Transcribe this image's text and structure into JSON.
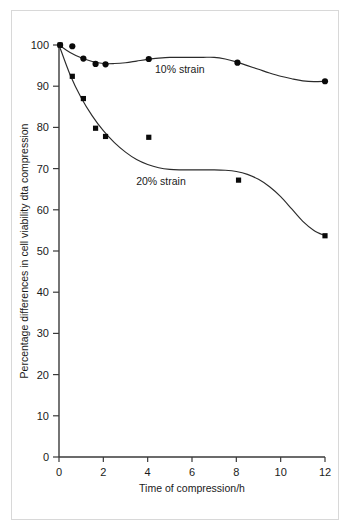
{
  "figure": {
    "kind": "scientific-line-chart",
    "background_color": "#ffffff",
    "frame_color": "#d8d8d8",
    "ink_color": "#1a1a1a"
  },
  "chart_data": {
    "type": "line",
    "title": "",
    "subtitle": "",
    "xlabel": "Time of compression/h",
    "ylabel": "Percentage differences in cell viability  dta compression",
    "xlim": [
      0,
      12
    ],
    "ylim": [
      0,
      100
    ],
    "xticks": [
      0,
      2,
      4,
      6,
      8,
      10,
      12
    ],
    "xtick_labels": [
      "0",
      "2",
      "4",
      "6",
      "8",
      "10",
      "12"
    ],
    "yticks": [
      0,
      10,
      20,
      30,
      40,
      50,
      60,
      70,
      80,
      90,
      100
    ],
    "ytick_labels": [
      "0",
      "10",
      "20",
      "30",
      "40",
      "50",
      "60",
      "70",
      "80",
      "90",
      "100"
    ],
    "grid": false,
    "legend_position": "inline-annotation",
    "series": [
      {
        "name": "10% strain",
        "marker": "circle",
        "marker_color": "#0a0a0a",
        "line_color": "#2b2b2b",
        "label_text": "10% strain",
        "x": [
          0.05,
          0.6,
          1.1,
          1.65,
          2.1,
          4.05,
          8.05,
          12.0
        ],
        "y": [
          100.0,
          99.7,
          96.7,
          95.4,
          95.3,
          96.6,
          95.7,
          91.2
        ],
        "curve_x": [
          0,
          0.5,
          1,
          1.5,
          2,
          2.5,
          3,
          3.5,
          4,
          4.5,
          5,
          5.5,
          6,
          6.5,
          7,
          7.5,
          8,
          8.5,
          9,
          9.5,
          10,
          10.5,
          11,
          11.5,
          12
        ],
        "curve_y": [
          100.0,
          98.2,
          96.9,
          96.0,
          95.5,
          95.5,
          95.7,
          96.1,
          96.5,
          96.8,
          97.0,
          97.0,
          97.0,
          97.0,
          97.0,
          96.6,
          95.9,
          95.0,
          94.1,
          93.2,
          92.4,
          91.8,
          91.3,
          91.1,
          91.2
        ]
      },
      {
        "name": "20% strain",
        "marker": "square",
        "marker_color": "#0a0a0a",
        "line_color": "#2b2b2b",
        "label_text": "20% strain",
        "x": [
          0.05,
          0.6,
          1.1,
          1.65,
          2.1,
          4.05,
          8.1,
          12.0
        ],
        "y": [
          100.0,
          92.4,
          87.0,
          79.8,
          77.8,
          77.6,
          67.2,
          53.7
        ],
        "curve_x": [
          0,
          0.5,
          1,
          1.5,
          2,
          2.5,
          3,
          3.5,
          4,
          4.5,
          5,
          5.5,
          6,
          6.5,
          7,
          7.5,
          8,
          8.5,
          9,
          9.5,
          10,
          10.5,
          11,
          11.5,
          12
        ],
        "curve_y": [
          100.0,
          92.8,
          87.2,
          82.8,
          79.2,
          76.3,
          74.0,
          72.2,
          71.0,
          70.2,
          69.8,
          69.7,
          69.7,
          69.7,
          69.7,
          69.6,
          69.3,
          68.6,
          67.4,
          65.6,
          63.2,
          60.2,
          57.2,
          55.0,
          53.7
        ]
      }
    ],
    "annotations": [
      {
        "text": "10% strain",
        "x": 5.45,
        "y": 93.2
      },
      {
        "text": "20% strain",
        "x": 4.6,
        "y": 66.0
      }
    ]
  }
}
